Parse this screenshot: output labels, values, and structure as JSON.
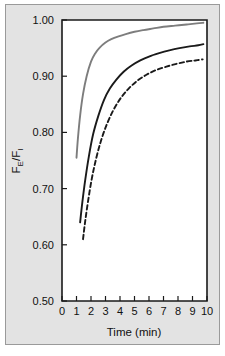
{
  "figure": {
    "background_color": "#e3e3e3",
    "border_color": "#9a9a9a",
    "plot_background": "#ffffff"
  },
  "chart_data": {
    "type": "line",
    "title": "",
    "subtitle": "",
    "xlabel": "Time (min)",
    "ylabel": "FE/FI",
    "ylabel_parts": {
      "numerator": "F",
      "numerator_sub": "E",
      "separator": "/",
      "denominator": "F",
      "denominator_sub": "I"
    },
    "xlim": [
      0,
      10
    ],
    "ylim": [
      0.5,
      1.0
    ],
    "xticks": [
      0,
      1,
      2,
      3,
      4,
      5,
      6,
      7,
      8,
      9,
      10
    ],
    "xtick_labels": [
      "0",
      "1",
      "2",
      "3",
      "4",
      "5",
      "6",
      "7",
      "8",
      "9",
      "10"
    ],
    "yticks": [
      0.5,
      0.6,
      0.7,
      0.8,
      0.9,
      1.0
    ],
    "ytick_labels": [
      "0.50",
      "0.60",
      "0.70",
      "0.80",
      "0.90",
      "1.00"
    ],
    "grid": false,
    "legend": null,
    "legend_position": "none",
    "series": [
      {
        "name": "upper-gray-curve",
        "color": "#7d7d7d",
        "style": "solid",
        "width": 1.9,
        "x": [
          1.0,
          1.1,
          1.25,
          1.45,
          1.7,
          2.0,
          2.3,
          2.6,
          3.0,
          3.4,
          3.9,
          4.4,
          5.0,
          5.6,
          6.3,
          7.0,
          7.8,
          8.6,
          9.3,
          9.75
        ],
        "y": [
          0.755,
          0.79,
          0.83,
          0.868,
          0.9,
          0.926,
          0.941,
          0.951,
          0.96,
          0.966,
          0.971,
          0.975,
          0.979,
          0.982,
          0.985,
          0.988,
          0.99,
          0.992,
          0.994,
          0.995
        ]
      },
      {
        "name": "middle-black-curve",
        "color": "#1a1a1a",
        "style": "solid",
        "width": 1.9,
        "x": [
          1.25,
          1.4,
          1.6,
          1.85,
          2.15,
          2.5,
          2.9,
          3.3,
          3.75,
          4.25,
          4.8,
          5.4,
          6.0,
          6.7,
          7.4,
          8.1,
          8.8,
          9.4,
          9.75
        ],
        "y": [
          0.64,
          0.675,
          0.715,
          0.757,
          0.797,
          0.829,
          0.858,
          0.878,
          0.894,
          0.908,
          0.919,
          0.928,
          0.935,
          0.941,
          0.946,
          0.95,
          0.953,
          0.955,
          0.957
        ]
      },
      {
        "name": "lower-dashed-curve",
        "color": "#1a1a1a",
        "style": "dashed",
        "width": 1.9,
        "dash_pattern": "4.5 3",
        "x": [
          1.45,
          1.6,
          1.8,
          2.05,
          2.35,
          2.7,
          3.1,
          3.55,
          4.05,
          4.6,
          5.2,
          5.85,
          6.5,
          7.2,
          7.9,
          8.6,
          9.2,
          9.7
        ],
        "y": [
          0.61,
          0.642,
          0.678,
          0.717,
          0.753,
          0.786,
          0.815,
          0.84,
          0.861,
          0.878,
          0.892,
          0.903,
          0.911,
          0.917,
          0.922,
          0.926,
          0.928,
          0.93
        ]
      }
    ]
  }
}
